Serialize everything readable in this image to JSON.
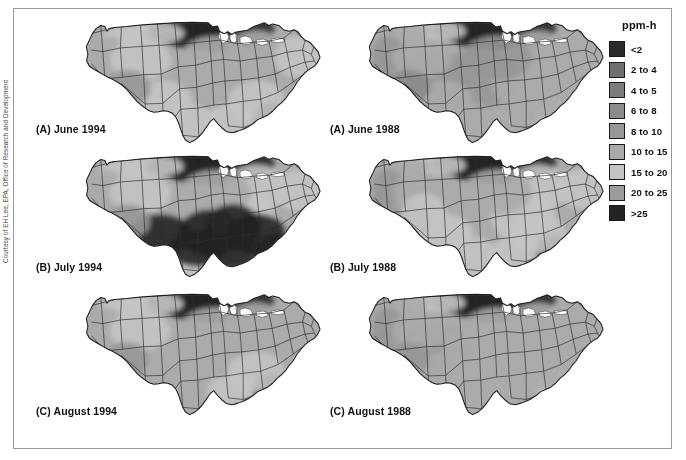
{
  "figure": {
    "credit": "Courtesy of EH Lee, EPA, Office of Research and Development"
  },
  "legend": {
    "title": "ppm-h",
    "items": [
      {
        "label": "<2",
        "color": "#2b2b2b"
      },
      {
        "label": "2 to 4",
        "color": "#6f6f6f"
      },
      {
        "label": "4 to 5",
        "color": "#7d7d7d"
      },
      {
        "label": "6 to 8",
        "color": "#8b8b8b"
      },
      {
        "label": "8 to 10",
        "color": "#979797"
      },
      {
        "label": "10 to 15",
        "color": "#ababab"
      },
      {
        "label": "15 to 20",
        "color": "#c4c4c4"
      },
      {
        "label": "20 to 25",
        "color": "#9b9b9b"
      },
      {
        "label": ">25",
        "color": "#232323"
      }
    ]
  },
  "maps": [
    {
      "id": "june-1994",
      "label": "(A) June 1994",
      "panel": "A",
      "month": "June",
      "year": "1994",
      "column": "left",
      "row": 0
    },
    {
      "id": "july-1994",
      "label": "(B) July 1994",
      "panel": "B",
      "month": "July",
      "year": "1994",
      "column": "left",
      "row": 1
    },
    {
      "id": "august-1994",
      "label": "(C) August 1994",
      "panel": "C",
      "month": "August",
      "year": "1994",
      "column": "left",
      "row": 2
    },
    {
      "id": "june-1988",
      "label": "(A) June 1988",
      "panel": "A",
      "month": "June",
      "year": "1988",
      "column": "right",
      "row": 0
    },
    {
      "id": "july-1988",
      "label": "(B) July 1988",
      "panel": "B",
      "month": "July",
      "year": "1988",
      "column": "right",
      "row": 1
    },
    {
      "id": "august-1988",
      "label": "(C) August 1988",
      "panel": "C",
      "month": "August",
      "year": "1988",
      "column": "right",
      "row": 2
    }
  ],
  "chart_data": {
    "type": "heatmap",
    "title": "ppm-h",
    "subtitle": "",
    "xlabel": "",
    "ylabel": "",
    "units": "ppm-h",
    "projection": "conterminous United States choropleth",
    "legend_position": "right",
    "grid": false,
    "bins": [
      {
        "label": "<2",
        "min": null,
        "max": 2,
        "color": "#2b2b2b"
      },
      {
        "label": "2 to 4",
        "min": 2,
        "max": 4,
        "color": "#6f6f6f"
      },
      {
        "label": "4 to 5",
        "min": 4,
        "max": 5,
        "color": "#7d7d7d"
      },
      {
        "label": "6 to 8",
        "min": 6,
        "max": 8,
        "color": "#8b8b8b"
      },
      {
        "label": "8 to 10",
        "min": 8,
        "max": 10,
        "color": "#979797"
      },
      {
        "label": "10 to 15",
        "min": 10,
        "max": 15,
        "color": "#ababab"
      },
      {
        "label": "15 to 20",
        "min": 15,
        "max": 20,
        "color": "#c4c4c4"
      },
      {
        "label": "20 to 25",
        "min": 20,
        "max": 25,
        "color": "#9b9b9b"
      },
      {
        "label": ">25",
        "min": 25,
        "max": null,
        "color": "#232323"
      }
    ],
    "panels": [
      {
        "label": "(A) June 1994",
        "month": "June",
        "year": 1994
      },
      {
        "label": "(B) July 1994",
        "month": "July",
        "year": 1994
      },
      {
        "label": "(C) August 1994",
        "month": "August",
        "year": 1994
      },
      {
        "label": "(A) June 1988",
        "month": "June",
        "year": 1988
      },
      {
        "label": "(B) July 1988",
        "month": "July",
        "year": 1988
      },
      {
        "label": "(C) August 1988",
        "month": "August",
        "year": 1988
      }
    ]
  }
}
